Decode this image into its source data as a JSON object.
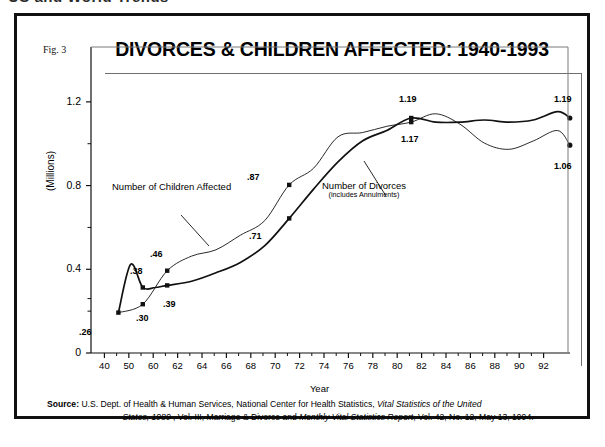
{
  "page": {
    "top_cut_text": "US and World Trends",
    "figure_label": "Fig. 3",
    "title": "DIVORCES & CHILDREN AFFECTED: 1940-1993"
  },
  "source": {
    "label": "Source:",
    "line1_a": "U.S. Dept. of Health & Human Services, National Center for Health Statistics, ",
    "line1_italic": "Vital Statistics of the United",
    "line2_italic_a": "States, 1989",
    "line2_b": " , Vol. III, Marriage & Divorce and  ",
    "line2_italic_b": "Monthly Vital Statistics Report",
    "line2_c": ", Vol. 42,  No. 12,  May 13, 1994."
  },
  "series_labels": {
    "children": "Number of Children Affected",
    "divorces_main": "Number of Divorces",
    "divorces_sub": "(includes Annulments)"
  },
  "chart_data": {
    "type": "line",
    "title": "DIVORCES & CHILDREN AFFECTED: 1940-1993",
    "xlabel": "Year",
    "ylabel": "(Millions)",
    "ylim": [
      0,
      1.4
    ],
    "yticks": [
      0,
      0.4,
      0.8,
      1.2
    ],
    "ytick_labels": [
      "0",
      "0.4",
      "0.8",
      "1.2"
    ],
    "y_minor_ticks": [
      0.2,
      0.6,
      1.0
    ],
    "grid": false,
    "legend": "inline-annotations",
    "xticks": [
      "40",
      "50",
      "60",
      "62",
      "64",
      "66",
      "68",
      "70",
      "72",
      "74",
      "76",
      "78",
      "80",
      "82",
      "84",
      "86",
      "88",
      "90",
      "92"
    ],
    "x_axis_note": "Non-uniform: 1940, 1950, then every 2 years from 1960 to 1992",
    "series": [
      {
        "name": "Number of Children Affected",
        "style": "thin-dotted",
        "x": [
          40,
          50,
          60,
          62,
          64,
          66,
          68,
          70,
          72,
          74,
          76,
          78,
          80,
          82,
          84,
          86,
          88,
          90,
          92,
          93
        ],
        "values": [
          0.26,
          0.3,
          0.46,
          0.53,
          0.56,
          0.63,
          0.7,
          0.87,
          0.95,
          1.1,
          1.12,
          1.15,
          1.17,
          1.21,
          1.16,
          1.07,
          1.04,
          1.08,
          1.13,
          1.06
        ],
        "labeled_points": [
          {
            "x": 50,
            "y": 0.3,
            "label": ".30"
          },
          {
            "x": 60,
            "y": 0.46,
            "label": ".46"
          },
          {
            "x": 70,
            "y": 0.87,
            "label": ".87"
          },
          {
            "x": 80,
            "y": 1.17,
            "label": "1.17"
          }
        ],
        "end_label": "1.06"
      },
      {
        "name": "Number of Divorces (includes Annulments)",
        "style": "thick-solid",
        "x": [
          40,
          45,
          50,
          55,
          60,
          62,
          64,
          66,
          68,
          70,
          72,
          74,
          76,
          78,
          80,
          82,
          84,
          86,
          88,
          90,
          92,
          93
        ],
        "values": [
          0.26,
          0.49,
          0.38,
          0.38,
          0.39,
          0.41,
          0.45,
          0.5,
          0.58,
          0.71,
          0.85,
          0.98,
          1.08,
          1.13,
          1.19,
          1.17,
          1.17,
          1.18,
          1.17,
          1.18,
          1.22,
          1.19
        ],
        "labeled_points": [
          {
            "x": 40,
            "y": 0.26,
            "label": ".26"
          },
          {
            "x": 50,
            "y": 0.38,
            "label": ".38"
          },
          {
            "x": 60,
            "y": 0.39,
            "label": ".39"
          },
          {
            "x": 70,
            "y": 0.71,
            "label": ".71"
          },
          {
            "x": 80,
            "y": 1.19,
            "label": "1.19"
          }
        ],
        "end_label": "1.19"
      }
    ],
    "annotations": [
      {
        "text": ".26",
        "x_px": 62,
        "y_px": 311
      },
      {
        "text": ".30",
        "x_px": 119,
        "y_px": 297
      },
      {
        "text": ".38",
        "x_px": 113,
        "y_px": 250
      },
      {
        "text": ".39",
        "x_px": 146,
        "y_px": 283
      },
      {
        "text": ".46",
        "x_px": 133,
        "y_px": 233
      },
      {
        "text": ".87",
        "x_px": 230,
        "y_px": 156
      },
      {
        "text": ".71",
        "x_px": 232,
        "y_px": 215
      },
      {
        "text": "1.19",
        "x_px": 382,
        "y_px": 78
      },
      {
        "text": "1.17",
        "x_px": 384,
        "y_px": 118
      },
      {
        "text": "1.19",
        "x_px": 537,
        "y_px": 78
      },
      {
        "text": "1.06",
        "x_px": 537,
        "y_px": 145
      }
    ]
  }
}
